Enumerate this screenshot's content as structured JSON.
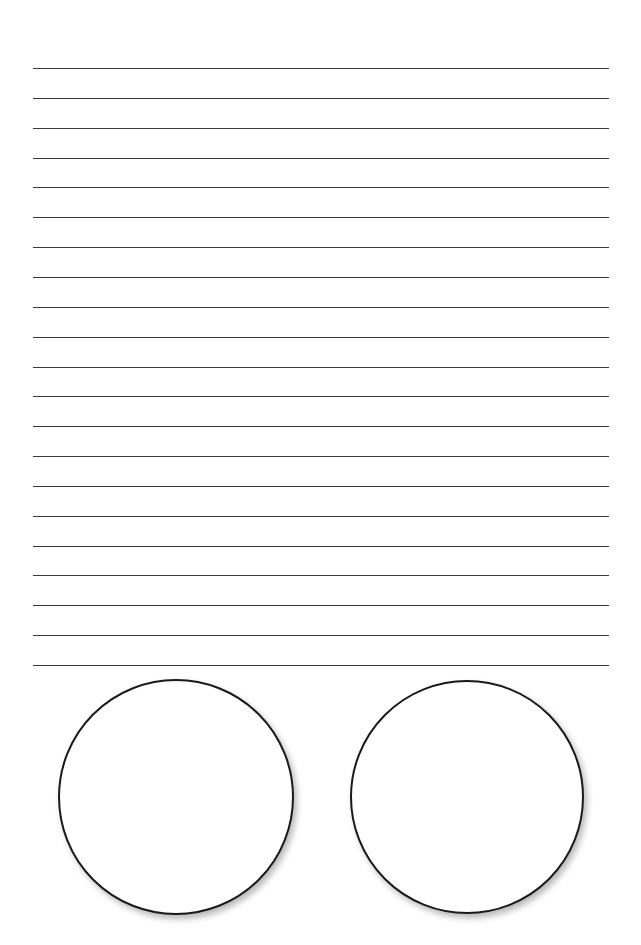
{
  "worksheet": {
    "ruled_lines": {
      "count": 21,
      "first_y": 68,
      "spacing": 29.85,
      "left_x": 33,
      "right_x": 609,
      "color": "#3a3a3a"
    },
    "circles": [
      {
        "label": "",
        "cx": 176,
        "cy": 797,
        "r": 118
      },
      {
        "label": "",
        "cx": 467,
        "cy": 797,
        "r": 117
      }
    ]
  }
}
